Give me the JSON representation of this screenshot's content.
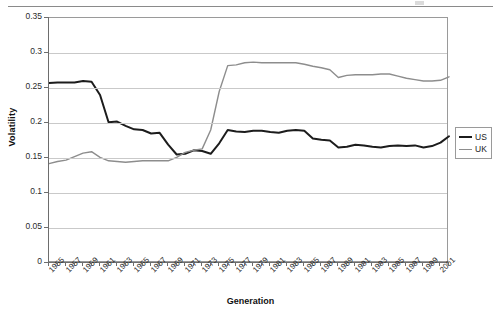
{
  "chart_data": {
    "type": "line",
    "title": "",
    "xlabel": "Generation",
    "ylabel": "Volatility",
    "ylim": [
      0,
      0.35
    ],
    "ytick_labels": [
      "0",
      "0.05",
      "0.1",
      "0.15",
      "0.2",
      "0.25",
      "0.3",
      "0.35"
    ],
    "ytick_values": [
      0,
      0.05,
      0.1,
      0.15,
      0.2,
      0.25,
      0.3,
      0.35
    ],
    "grid": "horizontal",
    "legend_position": "right",
    "xlim": [
      1955,
      2002
    ],
    "x": [
      1955,
      1956,
      1957,
      1958,
      1959,
      1960,
      1961,
      1962,
      1963,
      1964,
      1965,
      1966,
      1967,
      1968,
      1969,
      1970,
      1971,
      1972,
      1973,
      1974,
      1975,
      1976,
      1977,
      1978,
      1979,
      1980,
      1981,
      1982,
      1983,
      1984,
      1985,
      1986,
      1987,
      1988,
      1989,
      1990,
      1991,
      1992,
      1993,
      1994,
      1995,
      1996,
      1997,
      1998,
      1999,
      2000,
      2001,
      2002
    ],
    "xtick_labels": [
      "1955",
      "1957",
      "1959",
      "1961",
      "1963",
      "1965",
      "1967",
      "1969",
      "1971",
      "1973",
      "1975",
      "1977",
      "1979",
      "1981",
      "1983",
      "1985",
      "1987",
      "1989",
      "1991",
      "1993",
      "1995",
      "1997",
      "1999",
      "2001"
    ],
    "series": [
      {
        "name": "US",
        "color": "#1c1c1c",
        "width": 2,
        "values": [
          0.257,
          0.258,
          0.258,
          0.258,
          0.26,
          0.259,
          0.24,
          0.201,
          0.202,
          0.196,
          0.191,
          0.19,
          0.185,
          0.186,
          0.169,
          0.155,
          0.156,
          0.161,
          0.16,
          0.156,
          0.171,
          0.19,
          0.188,
          0.187,
          0.189,
          0.189,
          0.187,
          0.186,
          0.189,
          0.19,
          0.189,
          0.178,
          0.176,
          0.175,
          0.165,
          0.166,
          0.169,
          0.168,
          0.166,
          0.165,
          0.167,
          0.168,
          0.167,
          0.168,
          0.165,
          0.167,
          0.172,
          0.181
        ]
      },
      {
        "name": "UK",
        "color": "#8d8d8d",
        "width": 1.4,
        "values": [
          0.142,
          0.145,
          0.147,
          0.152,
          0.157,
          0.159,
          0.151,
          0.146,
          0.145,
          0.144,
          0.145,
          0.146,
          0.146,
          0.146,
          0.146,
          0.151,
          0.158,
          0.161,
          0.163,
          0.19,
          0.245,
          0.282,
          0.283,
          0.286,
          0.287,
          0.286,
          0.286,
          0.286,
          0.286,
          0.286,
          0.284,
          0.281,
          0.279,
          0.276,
          0.265,
          0.268,
          0.269,
          0.269,
          0.269,
          0.27,
          0.27,
          0.267,
          0.264,
          0.262,
          0.26,
          0.26,
          0.261,
          0.266
        ]
      }
    ]
  },
  "legend": {
    "items": [
      {
        "label": "US"
      },
      {
        "label": "UK"
      }
    ]
  },
  "axis_titles": {
    "y": "Volatility",
    "x": "Generation"
  }
}
